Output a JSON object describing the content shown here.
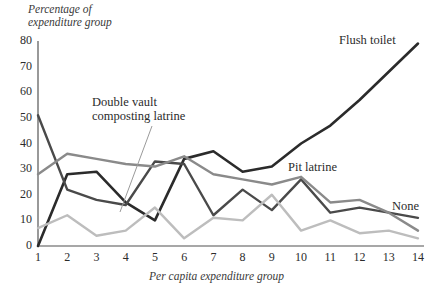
{
  "chart_data": {
    "type": "line",
    "title": "",
    "xlabel": "Per capita expenditure group",
    "ylabel": "Percentage of expenditure group",
    "x": [
      1,
      2,
      3,
      4,
      5,
      6,
      7,
      8,
      9,
      10,
      11,
      12,
      13,
      14
    ],
    "xtick_labels": [
      "1",
      "2",
      "3",
      "4",
      "5",
      "6",
      "7",
      "8",
      "9",
      "10",
      "11",
      "12",
      "13",
      "14"
    ],
    "ytick_labels": [
      "0",
      "10",
      "20",
      "30",
      "40",
      "50",
      "60",
      "70",
      "80"
    ],
    "ytick_values": [
      0,
      10,
      20,
      30,
      40,
      50,
      60,
      70,
      80
    ],
    "xlim": [
      1,
      14
    ],
    "ylim": [
      0,
      80
    ],
    "grid": false,
    "legend": "inline-annotations",
    "series": [
      {
        "name": "Flush toilet",
        "color": "#2b2b2b",
        "width": 2.6,
        "values": [
          0,
          28,
          29,
          17,
          10,
          34,
          37,
          29,
          31,
          40,
          47,
          57,
          68,
          79
        ]
      },
      {
        "name": "Double vault composting latrine",
        "color": "#4a4a4a",
        "width": 2.4,
        "values": [
          51,
          22,
          18,
          16,
          33,
          32,
          12,
          22,
          14,
          26,
          13,
          15,
          13,
          11
        ]
      },
      {
        "name": "Pit latrine",
        "color": "#8a8a8a",
        "width": 2.4,
        "values": [
          28,
          36,
          34,
          32,
          31,
          35,
          28,
          26,
          24,
          27,
          17,
          18,
          13,
          6
        ]
      },
      {
        "name": "None",
        "color": "#bdbdbd",
        "width": 2.4,
        "values": [
          7,
          12,
          4,
          6,
          15,
          3,
          11,
          10,
          20,
          6,
          10,
          5,
          6,
          3
        ]
      }
    ],
    "annotations": [
      {
        "id": "flush-toilet",
        "text": "Flush toilet",
        "x": 339,
        "y": 33
      },
      {
        "id": "double-vault",
        "line1": "Double vault",
        "line2": "composting latrine",
        "x": 92,
        "y": 95
      },
      {
        "id": "pit-latrine",
        "text": "Pit latrine",
        "x": 288,
        "y": 160
      },
      {
        "id": "none",
        "text": "None",
        "x": 392,
        "y": 199
      }
    ],
    "leader_line": {
      "id": "double-vault-leader",
      "x1": 152,
      "y1": 126,
      "x2": 120,
      "y2": 212
    }
  },
  "axis": {
    "y_title_line1": "Percentage of",
    "y_title_line2": "expenditure group",
    "x_title": "Per capita expenditure group"
  }
}
